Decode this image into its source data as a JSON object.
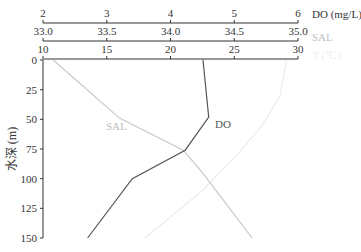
{
  "chart_data": {
    "type": "line",
    "title": "",
    "orientation": "depth-profile (depth on inverted y-axis, multiple stacked x-axes on top)",
    "ylabel": "水深 (m)",
    "yticks": [
      0,
      25,
      50,
      75,
      100,
      125,
      150
    ],
    "ylim": [
      0,
      150
    ],
    "x_axes": [
      {
        "key": "do",
        "label": "DO (mg/L)",
        "ticks": [
          "2",
          "3",
          "4",
          "5",
          "6"
        ],
        "range": [
          2,
          6
        ],
        "color": "#333333",
        "label_color": "#333333"
      },
      {
        "key": "sal",
        "label": "SAL",
        "ticks": [
          "33.0",
          "33.5",
          "34.0",
          "34.5",
          "35.0"
        ],
        "range": [
          33.0,
          35.0
        ],
        "color": "#333333",
        "label_color": "#c0c0c0"
      },
      {
        "key": "t",
        "label": "T (℃)",
        "ticks": [
          "10",
          "15",
          "20",
          "25",
          "30"
        ],
        "range": [
          10,
          30
        ],
        "color": "#333333",
        "label_color": "#f0f0f0"
      }
    ],
    "series": [
      {
        "name": "DO",
        "axis": "do",
        "color": "#555555",
        "label_pos": [
          215,
          128
        ],
        "points": [
          [
            4.51,
            0
          ],
          [
            4.6,
            48
          ],
          [
            4.23,
            76
          ],
          [
            3.4,
            100
          ],
          [
            2.7,
            150
          ]
        ]
      },
      {
        "name": "SAL",
        "axis": "sal",
        "color": "#c8c8c8",
        "label_pos": [
          106,
          130
        ],
        "points": [
          [
            33.08,
            0
          ],
          [
            33.6,
            49
          ],
          [
            34.1,
            76
          ],
          [
            34.25,
            95
          ],
          [
            34.64,
            150
          ]
        ]
      },
      {
        "name": "T",
        "axis": "t",
        "color": "#ececec",
        "label_pos": null,
        "points": [
          [
            29.1,
            0
          ],
          [
            28.6,
            30
          ],
          [
            27.2,
            55
          ],
          [
            25.2,
            80
          ],
          [
            22.5,
            110
          ],
          [
            18.0,
            150
          ]
        ]
      }
    ],
    "grid": false,
    "legend": "inline labels"
  },
  "labels": {
    "ylabel": "水深 (m)",
    "do_axis": "DO (mg/L)",
    "sal_axis": "SAL",
    "t_axis": "T (℃)",
    "do_series": "DO",
    "sal_series": "SAL"
  }
}
